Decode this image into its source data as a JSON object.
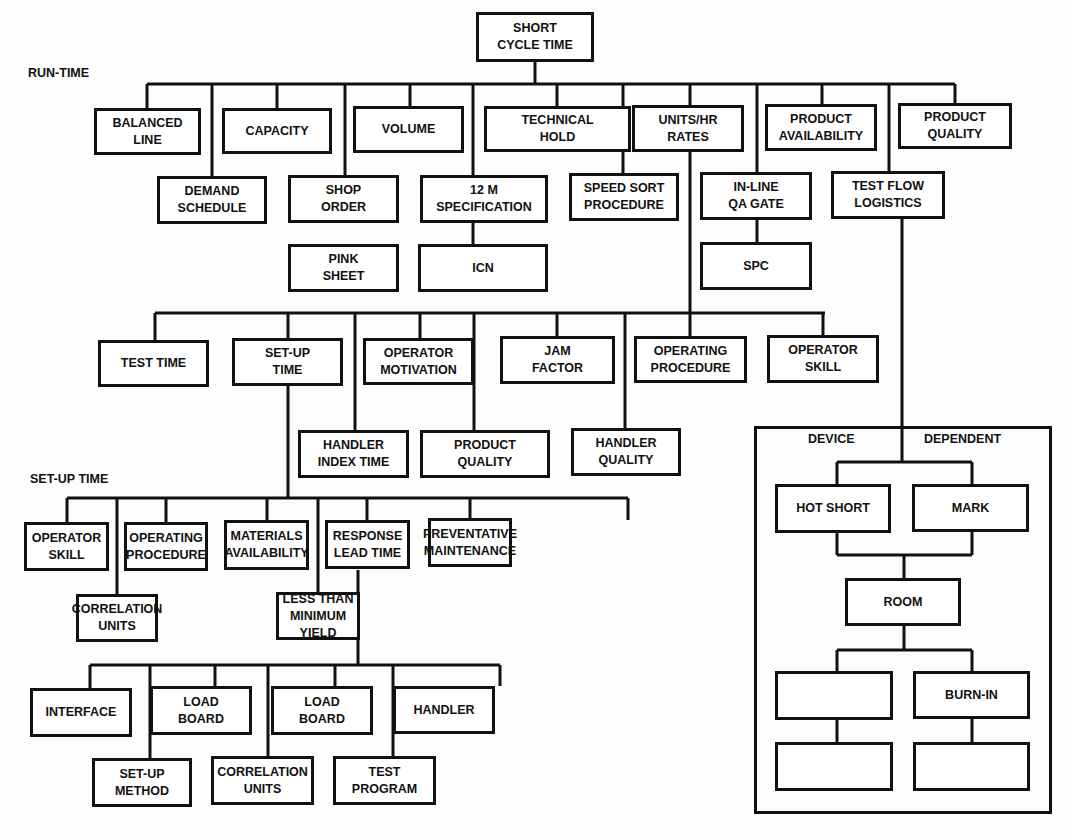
{
  "root": "SHORT\nCYCLE TIME",
  "sections": {
    "run_time": "RUN-TIME",
    "set_up_time": "SET-UP TIME"
  },
  "run_time_top": [
    "BALANCED\nLINE",
    "CAPACITY",
    "VOLUME",
    "TECHNICAL\nHOLD",
    "UNITS/HR\nRATES",
    "PRODUCT\nAVAILABILITY",
    "PRODUCT\nQUALITY"
  ],
  "run_time_second": [
    "DEMAND\nSCHEDULE",
    "SHOP\nORDER",
    "12 M\nSPECIFICATION",
    "SPEED SORT\nPROCEDURE",
    "IN-LINE\nQA GATE",
    "TEST FLOW\nLOGISTICS"
  ],
  "run_time_third": [
    "PINK\nSHEET",
    "ICN",
    "SPC"
  ],
  "units_hr_children_top": [
    "TEST TIME",
    "SET-UP\nTIME",
    "OPERATOR\nMOTIVATION",
    "JAM\nFACTOR",
    "OPERATING\nPROCEDURE",
    "OPERATOR\nSKILL"
  ],
  "units_hr_children_second": [
    "HANDLER\nINDEX TIME",
    "PRODUCT\nQUALITY",
    "HANDLER\nQUALITY"
  ],
  "setup_children_top": [
    "OPERATOR\nSKILL",
    "OPERATING\nPROCEDURE",
    "MATERIALS\nAVAILABILITY",
    "RESPONSE\nLEAD TIME",
    "PREVENTATIVE\nMAINTENANCE"
  ],
  "setup_children_second": [
    "CORRELATION\nUNITS",
    "LESS THAN\nMINIMUM YIELD"
  ],
  "materials_children_top": [
    "INTERFACE",
    "LOAD\nBOARD",
    "LOAD\nBOARD",
    "HANDLER"
  ],
  "materials_children_second": [
    "SET-UP\nMETHOD",
    "CORRELATION\nUNITS",
    "TEST\nPROGRAM"
  ],
  "device_dependent": {
    "label_left": "DEVICE",
    "label_right": "DEPENDENT",
    "row1": [
      "HOT SHORT",
      "MARK"
    ],
    "middle": "ROOM",
    "row2": [
      "",
      "BURN-IN"
    ],
    "row3": [
      "",
      ""
    ]
  }
}
